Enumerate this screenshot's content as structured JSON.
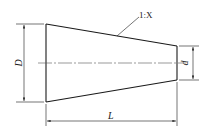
{
  "diagram": {
    "title": "",
    "type": "tapered-cone-dimension-drawing",
    "labels": {
      "taper_ratio": "1:X",
      "large_diameter": "D",
      "small_diameter": "d",
      "length": "L"
    },
    "colors": {
      "line": "#1a1a1a",
      "centerline": "#555555",
      "background": "#ffffff"
    },
    "geometry": {
      "large_end": {
        "x": 46,
        "top": 24,
        "bottom": 102
      },
      "small_end": {
        "x": 177,
        "top": 46,
        "bottom": 80
      },
      "centerline_y": 63,
      "dim_D_x": 24,
      "dim_d_x": 193,
      "dim_L_y": 121
    }
  }
}
